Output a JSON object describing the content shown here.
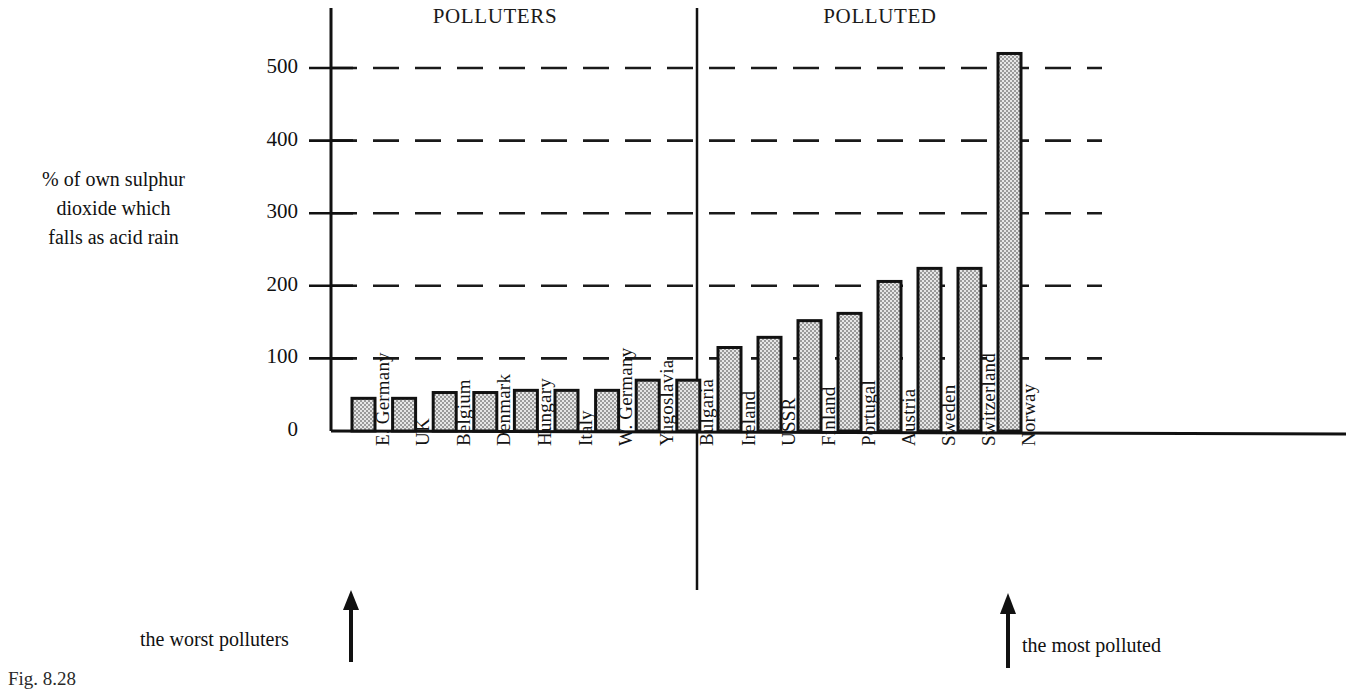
{
  "figure": {
    "caption": "Fig. 8.28",
    "y_axis_title_lines": [
      "% of own sulphur",
      "dioxide which",
      "falls as acid rain"
    ],
    "annotations": [
      {
        "name": "worst-polluters",
        "text": "the worst polluters"
      },
      {
        "name": "most-polluted",
        "text": "the most polluted"
      }
    ],
    "colors": {
      "ink": "#111111",
      "bar_fill": "#d9d9d9",
      "bar_stroke": "#111111",
      "gridline": "#1a1a1a"
    }
  },
  "chart_data": {
    "type": "bar",
    "title": "",
    "xlabel": "",
    "ylabel": "% of own sulphur dioxide which falls as acid rain",
    "ylim": [
      0,
      560
    ],
    "yticks": [
      0,
      100,
      200,
      300,
      400,
      500
    ],
    "grid": "horizontal-dashed",
    "legend": "none",
    "group_titles": [
      "POLLUTERS",
      "POLLUTED"
    ],
    "categories": [
      "E. Germany",
      "UK",
      "Belgium",
      "Denmark",
      "Hungary",
      "Italy",
      "W. Germany",
      "Yugoslavia",
      "Bulgaria",
      "Ireland",
      "USSR",
      "Finland",
      "Portugal",
      "Austria",
      "Sweden",
      "Switzerland",
      "Norway"
    ],
    "values": [
      45,
      45,
      53,
      53,
      56,
      56,
      56,
      70,
      70,
      115,
      129,
      152,
      162,
      206,
      224,
      224,
      520
    ],
    "groups": [
      {
        "name": "POLLUTERS",
        "categories": [
          "E. Germany",
          "UK",
          "Belgium",
          "Denmark",
          "Hungary",
          "Italy",
          "W. Germany",
          "Yugoslavia",
          "Bulgaria"
        ],
        "values": [
          45,
          45,
          53,
          53,
          56,
          56,
          56,
          70,
          70
        ]
      },
      {
        "name": "POLLUTED",
        "categories": [
          "Ireland",
          "USSR",
          "Finland",
          "Portugal",
          "Austria",
          "Sweden",
          "Switzerland",
          "Norway"
        ],
        "values": [
          115,
          129,
          152,
          162,
          206,
          224,
          224,
          520
        ]
      }
    ]
  }
}
